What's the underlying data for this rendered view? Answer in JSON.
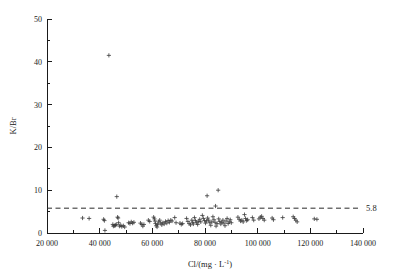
{
  "chart_data": {
    "type": "scatter",
    "title": "",
    "xlabel": "Cl/(mg · L⁻¹)",
    "ylabel": "K/Br",
    "xlim": [
      20000,
      140000
    ],
    "ylim": [
      0,
      50
    ],
    "grid": false,
    "legend": null,
    "marker": "plus",
    "xticks": [
      20000,
      40000,
      60000,
      80000,
      100000,
      120000,
      140000
    ],
    "xtick_labels": [
      "20 000",
      "40 000",
      "60 000",
      "80 000",
      "100 000",
      "120 000",
      "140 000"
    ],
    "xminor_ticks": [
      30000,
      50000,
      70000,
      90000,
      110000,
      130000
    ],
    "yticks": [
      0,
      10,
      20,
      30,
      40,
      50
    ],
    "ytick_labels": [
      "0",
      "10",
      "20",
      "30",
      "40",
      "50"
    ],
    "yminor_ticks": [
      5,
      15,
      25,
      35,
      45
    ],
    "reference_line": {
      "value": 5.8,
      "label": "5.8",
      "style": "dashed",
      "orientation": "horizontal"
    },
    "points": [
      [
        33500,
        3.5
      ],
      [
        36000,
        3.4
      ],
      [
        41500,
        3.2
      ],
      [
        41800,
        2.9
      ],
      [
        42000,
        0.6
      ],
      [
        43500,
        41.5
      ],
      [
        45000,
        2.0
      ],
      [
        45200,
        1.6
      ],
      [
        45600,
        1.7
      ],
      [
        46000,
        1.8
      ],
      [
        46300,
        2.0
      ],
      [
        46500,
        8.5
      ],
      [
        46800,
        3.7
      ],
      [
        47000,
        3.5
      ],
      [
        47200,
        2.4
      ],
      [
        47500,
        1.6
      ],
      [
        48000,
        1.8
      ],
      [
        48400,
        1.5
      ],
      [
        49000,
        1.7
      ],
      [
        49500,
        1.4
      ],
      [
        51000,
        2.4
      ],
      [
        51500,
        2.2
      ],
      [
        52000,
        2.6
      ],
      [
        52500,
        2.3
      ],
      [
        53000,
        2.5
      ],
      [
        55500,
        2.3
      ],
      [
        56000,
        2.0
      ],
      [
        56400,
        1.6
      ],
      [
        56800,
        2.0
      ],
      [
        58500,
        3.0
      ],
      [
        59000,
        2.7
      ],
      [
        60500,
        3.7
      ],
      [
        60800,
        3.3
      ],
      [
        61000,
        2.8
      ],
      [
        61200,
        2.2
      ],
      [
        61500,
        1.7
      ],
      [
        61800,
        1.4
      ],
      [
        62000,
        2.0
      ],
      [
        62400,
        2.6
      ],
      [
        62800,
        3.0
      ],
      [
        63200,
        2.3
      ],
      [
        63600,
        1.9
      ],
      [
        64000,
        2.4
      ],
      [
        64500,
        2.1
      ],
      [
        65000,
        2.7
      ],
      [
        65500,
        2.3
      ],
      [
        66000,
        2.9
      ],
      [
        66500,
        2.5
      ],
      [
        67000,
        3.0
      ],
      [
        67500,
        2.8
      ],
      [
        68500,
        3.6
      ],
      [
        69000,
        2.4
      ],
      [
        70500,
        2.3
      ],
      [
        71000,
        2.0
      ],
      [
        71500,
        2.2
      ],
      [
        73000,
        3.4
      ],
      [
        73500,
        2.7
      ],
      [
        74000,
        2.2
      ],
      [
        74500,
        1.9
      ],
      [
        75000,
        3.0
      ],
      [
        75300,
        2.5
      ],
      [
        75600,
        2.1
      ],
      [
        76000,
        3.6
      ],
      [
        76400,
        2.9
      ],
      [
        76800,
        2.4
      ],
      [
        77200,
        2.0
      ],
      [
        77600,
        2.7
      ],
      [
        78000,
        3.2
      ],
      [
        78400,
        2.6
      ],
      [
        79000,
        4.1
      ],
      [
        79400,
        3.4
      ],
      [
        79800,
        2.9
      ],
      [
        80200,
        2.3
      ],
      [
        80600,
        2.8
      ],
      [
        80800,
        8.7
      ],
      [
        81000,
        3.5
      ],
      [
        81400,
        3.0
      ],
      [
        81800,
        2.4
      ],
      [
        82200,
        1.8
      ],
      [
        82600,
        2.6
      ],
      [
        83000,
        3.8
      ],
      [
        83400,
        3.1
      ],
      [
        83800,
        2.5
      ],
      [
        84000,
        6.3
      ],
      [
        84200,
        1.6
      ],
      [
        84600,
        2.2
      ],
      [
        85000,
        10.0
      ],
      [
        85200,
        3.3
      ],
      [
        85600,
        2.7
      ],
      [
        86000,
        2.1
      ],
      [
        86400,
        2.5
      ],
      [
        86800,
        3.0
      ],
      [
        87200,
        2.3
      ],
      [
        87600,
        1.7
      ],
      [
        88000,
        2.8
      ],
      [
        88400,
        3.4
      ],
      [
        88800,
        2.2
      ],
      [
        89200,
        2.6
      ],
      [
        89600,
        3.1
      ],
      [
        90000,
        2.4
      ],
      [
        92500,
        3.7
      ],
      [
        93000,
        3.2
      ],
      [
        93500,
        2.8
      ],
      [
        94000,
        3.0
      ],
      [
        94500,
        2.6
      ],
      [
        95000,
        4.3
      ],
      [
        95400,
        3.4
      ],
      [
        95800,
        2.9
      ],
      [
        96200,
        3.1
      ],
      [
        98000,
        3.6
      ],
      [
        98500,
        3.0
      ],
      [
        100500,
        3.3
      ],
      [
        101000,
        3.7
      ],
      [
        101500,
        3.9
      ],
      [
        102000,
        3.4
      ],
      [
        102500,
        3.0
      ],
      [
        105500,
        3.5
      ],
      [
        106000,
        3.1
      ],
      [
        109500,
        3.6
      ],
      [
        113500,
        3.8
      ],
      [
        114000,
        3.4
      ],
      [
        114500,
        3.0
      ],
      [
        115000,
        2.6
      ],
      [
        121500,
        3.3
      ],
      [
        122500,
        3.2
      ]
    ]
  },
  "figure": {
    "axis_color": "#1a1a1a",
    "marker_color": "#3b3b3b",
    "reference_line_color": "#2a2a2a",
    "background": "#ffffff"
  }
}
